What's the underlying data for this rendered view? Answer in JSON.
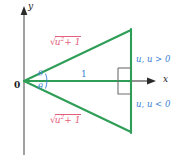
{
  "figure": {
    "type": "geometry-diagram",
    "background_color": "#ffffff"
  },
  "colors": {
    "axis": "#4a4a4a",
    "axis_text": "#1a1a1a",
    "triangle": "#2e9e57",
    "hypotenuse_label": "#e4607b",
    "side_label": "#3a7fd5",
    "angle_label": "#3a7fd5"
  },
  "axes": {
    "x_label": "x",
    "y_label": "y",
    "origin_label": "0"
  },
  "labels": {
    "hypotenuse_upper": {
      "radical_sign": "√",
      "radicand_base": "u",
      "radicand_exponent": "2",
      "radicand_rest": "+ 1",
      "full_text": "√(u² + 1)"
    },
    "hypotenuse_lower": {
      "radical_sign": "√",
      "radicand_base": "u",
      "radicand_exponent": "2",
      "radicand_rest": "+ 1",
      "full_text": "√(u² + 1)"
    },
    "adjacent": "1",
    "opposite_upper": "u, u > 0",
    "opposite_lower": "u, u < 0",
    "angle_upper": "θ",
    "angle_lower": "θ"
  },
  "geometry": {
    "origin": {
      "x": 24,
      "y": 81
    },
    "apex_upper": {
      "x": 131,
      "y": 30
    },
    "apex_lower": {
      "x": 131,
      "y": 132
    },
    "x_axis_end": {
      "x": 152,
      "y": 81
    },
    "y_axis_top": {
      "y": 8
    },
    "y_axis_bottom": {
      "y": 155
    },
    "right_angle_marker": {
      "x": 118,
      "y": 69,
      "size": 13
    }
  }
}
